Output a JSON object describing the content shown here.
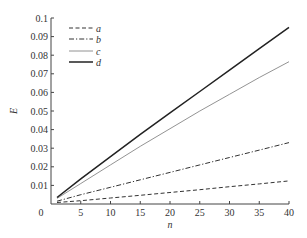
{
  "chart_data": {
    "type": "line",
    "title": "",
    "xlabel": "n",
    "ylabel": "E",
    "xlim": [
      0,
      40
    ],
    "ylim": [
      0,
      0.1
    ],
    "grid": false,
    "legend_position": "upper-left",
    "x_ticks": [
      0,
      5,
      10,
      15,
      20,
      25,
      30,
      35,
      40
    ],
    "x_tick_labels": [
      "0",
      "5",
      "10",
      "15",
      "20",
      "25",
      "30",
      "35",
      "40"
    ],
    "y_ticks": [
      0.01,
      0.02,
      0.03,
      0.04,
      0.05,
      0.06,
      0.07,
      0.08,
      0.09,
      0.1
    ],
    "y_tick_labels": [
      "0.01",
      "0.02",
      "0.03",
      "0.04",
      "0.05",
      "0.06",
      "0.07",
      "0.08",
      "0.09",
      "0.1"
    ],
    "x": [
      1,
      5,
      10,
      15,
      20,
      25,
      30,
      35,
      40
    ],
    "series": [
      {
        "name": "a",
        "style": "dashed",
        "color": "#333333",
        "width": 1.0,
        "values": [
          0.0008,
          0.0018,
          0.0032,
          0.0047,
          0.0062,
          0.0077,
          0.0093,
          0.0108,
          0.0124
        ]
      },
      {
        "name": "b",
        "style": "dash-dot",
        "color": "#333333",
        "width": 1.0,
        "values": [
          0.0015,
          0.005,
          0.009,
          0.013,
          0.017,
          0.021,
          0.025,
          0.029,
          0.033
        ]
      },
      {
        "name": "c",
        "style": "solid-thin",
        "color": "#777777",
        "width": 0.8,
        "values": [
          0.003,
          0.011,
          0.021,
          0.031,
          0.0405,
          0.05,
          0.059,
          0.068,
          0.0765
        ]
      },
      {
        "name": "d",
        "style": "solid-thick",
        "color": "#222222",
        "width": 1.5,
        "values": [
          0.0035,
          0.0135,
          0.0255,
          0.0375,
          0.049,
          0.0605,
          0.072,
          0.0835,
          0.095
        ]
      }
    ]
  },
  "layout": {
    "plot_left": 51,
    "plot_right": 289,
    "plot_top": 18,
    "plot_bottom": 204
  }
}
